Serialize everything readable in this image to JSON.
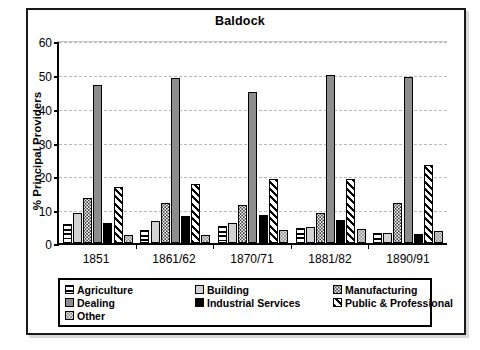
{
  "figure": {
    "title": "Baldock",
    "ylabel": "% Principal Providers"
  },
  "legend": {
    "items": [
      {
        "label": "Agriculture",
        "pattern": "horizontal-lines"
      },
      {
        "label": "Building",
        "pattern": "light-gray-solid"
      },
      {
        "label": "Manufacturing",
        "pattern": "dotted"
      },
      {
        "label": "Dealing",
        "pattern": "gray-solid"
      },
      {
        "label": "Industrial Services",
        "pattern": "black-solid"
      },
      {
        "label": "Public & Professional",
        "pattern": "diagonal-hatch"
      },
      {
        "label": "Other",
        "pattern": "light-dotted"
      }
    ]
  },
  "axis": {
    "yticks": [
      "0",
      "10",
      "20",
      "30",
      "40",
      "50",
      "60"
    ],
    "xticks": [
      "1851",
      "1861/62",
      "1870/71",
      "1881/82",
      "1890/91"
    ]
  },
  "chart_data": {
    "type": "bar",
    "title": "Baldock",
    "xlabel": "",
    "ylabel": "% Principal Providers",
    "ylim": [
      0,
      60
    ],
    "ytick_step": 10,
    "grid": true,
    "legend_position": "bottom",
    "categories": [
      "1851",
      "1861/62",
      "1870/71",
      "1881/82",
      "1890/91"
    ],
    "series": [
      {
        "name": "Agriculture",
        "values": [
          5.7,
          3.8,
          5.0,
          4.3,
          3.1
        ]
      },
      {
        "name": "Building",
        "values": [
          9.0,
          6.6,
          5.9,
          4.7,
          3.1
        ]
      },
      {
        "name": "Manufacturing",
        "values": [
          13.3,
          11.7,
          11.1,
          8.9,
          11.9
        ]
      },
      {
        "name": "Dealing",
        "values": [
          46.7,
          48.8,
          44.7,
          49.7,
          49.2
        ]
      },
      {
        "name": "Industrial Services",
        "values": [
          5.8,
          7.9,
          8.2,
          6.7,
          2.7
        ]
      },
      {
        "name": "Public & Professional",
        "values": [
          16.5,
          17.4,
          19.0,
          18.8,
          23.1
        ]
      },
      {
        "name": "Other",
        "values": [
          2.3,
          2.5,
          3.9,
          4.2,
          3.5
        ]
      }
    ]
  }
}
